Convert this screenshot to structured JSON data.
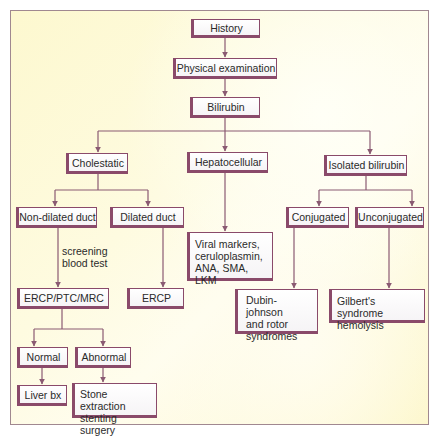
{
  "diagram": {
    "type": "flowchart",
    "colors": {
      "box_border": "#8a4a6a",
      "arrow": "#8a5a72",
      "frame_border": "#a08890",
      "background": "#fdf8cf"
    },
    "nodes": {
      "history": {
        "label": "History"
      },
      "physical_exam": {
        "label": "Physical examination"
      },
      "bilirubin": {
        "label": "Bilirubin"
      },
      "cholestatic": {
        "label": "Cholestatic"
      },
      "hepatocellular": {
        "label": "Hepatocellular"
      },
      "isolated_bilirubin": {
        "label": "Isolated bilirubin"
      },
      "non_dilated_duct": {
        "label": "Non-dilated duct"
      },
      "dilated_duct": {
        "label": "Dilated duct"
      },
      "viral_markers": {
        "lines": [
          "Viral markers,",
          "ceruloplasmin,",
          "ANA, SMA, LKM"
        ]
      },
      "conjugated": {
        "label": "Conjugated"
      },
      "unconjugated": {
        "label": "Unconjugated"
      },
      "ercp_ptc_mrc": {
        "label": "ERCP/PTC/MRC"
      },
      "ercp": {
        "label": "ERCP"
      },
      "dubin_johnson": {
        "lines": [
          "Dubin-johnson",
          "and rotor",
          "syndromes"
        ]
      },
      "gilbert": {
        "lines": [
          "Gilbert's syndrome",
          "hemolysis"
        ]
      },
      "normal": {
        "label": "Normal"
      },
      "abnormal": {
        "label": "Abnormal"
      },
      "liver_bx": {
        "label": "Liver bx"
      },
      "stone_extraction": {
        "lines": [
          "Stone extraction",
          "stenting surgery"
        ]
      }
    },
    "edge_labels": {
      "screening": {
        "lines": [
          "screening",
          "blood test"
        ]
      }
    },
    "edges": [
      {
        "from": "history",
        "to": "physical_exam"
      },
      {
        "from": "physical_exam",
        "to": "bilirubin"
      },
      {
        "from": "bilirubin",
        "to": "cholestatic"
      },
      {
        "from": "bilirubin",
        "to": "hepatocellular"
      },
      {
        "from": "bilirubin",
        "to": "isolated_bilirubin"
      },
      {
        "from": "cholestatic",
        "to": "non_dilated_duct"
      },
      {
        "from": "cholestatic",
        "to": "dilated_duct"
      },
      {
        "from": "hepatocellular",
        "to": "viral_markers"
      },
      {
        "from": "isolated_bilirubin",
        "to": "conjugated"
      },
      {
        "from": "isolated_bilirubin",
        "to": "unconjugated"
      },
      {
        "from": "non_dilated_duct",
        "to": "ercp_ptc_mrc",
        "label": "screening blood test"
      },
      {
        "from": "dilated_duct",
        "to": "ercp"
      },
      {
        "from": "conjugated",
        "to": "dubin_johnson"
      },
      {
        "from": "unconjugated",
        "to": "gilbert"
      },
      {
        "from": "ercp_ptc_mrc",
        "to": "normal"
      },
      {
        "from": "ercp_ptc_mrc",
        "to": "abnormal"
      },
      {
        "from": "normal",
        "to": "liver_bx"
      },
      {
        "from": "abnormal",
        "to": "stone_extraction"
      }
    ]
  }
}
